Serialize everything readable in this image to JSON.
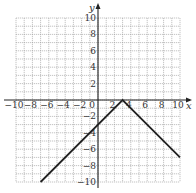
{
  "chart_data": {
    "type": "line",
    "title": "",
    "xlabel": "x",
    "ylabel": "y",
    "xlim": [
      -10,
      10
    ],
    "ylim": [
      -10,
      10
    ],
    "grid": true,
    "grid_step": 1,
    "x_ticks": [
      -10,
      -8,
      -6,
      -4,
      -2,
      0,
      2,
      4,
      6,
      8,
      10
    ],
    "x_tick_labels": [
      "−10",
      "−8",
      "−6",
      "−4",
      "−2",
      "0",
      "2",
      "4",
      "6",
      "8",
      "10"
    ],
    "y_ticks": [
      10,
      8,
      6,
      4,
      2,
      -2,
      -4,
      -6,
      -8,
      -10
    ],
    "y_tick_labels": [
      "10",
      "8",
      "6",
      "4",
      "2",
      "−2",
      "−4",
      "−6",
      "−8",
      "−10"
    ],
    "series": [
      {
        "name": "y = -|x - 3|",
        "points": [
          [
            -7,
            -10
          ],
          [
            3,
            0
          ],
          [
            10,
            -7
          ]
        ],
        "color": "#222222"
      }
    ],
    "legend": null
  },
  "colors": {
    "grid": "#9a9a9a",
    "axis": "#222222",
    "line": "#222222",
    "background": "#ffffff"
  }
}
